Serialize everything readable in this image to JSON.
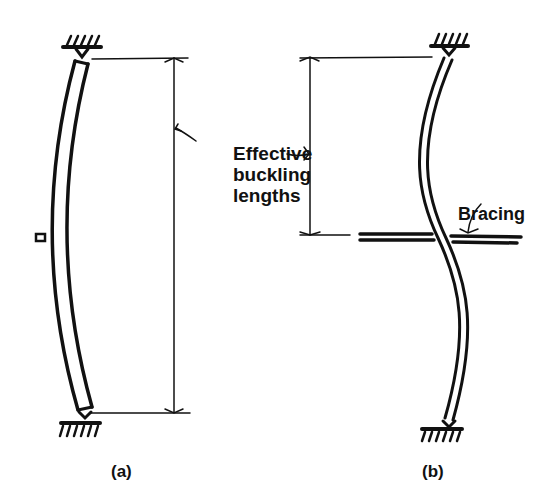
{
  "figure": {
    "annotation": {
      "line1": "Effective",
      "line2": "buckling",
      "line3": "lengths"
    },
    "bracing_label": "Bracing",
    "panels": [
      {
        "caption": "(a)",
        "description": "Pinned column buckling in single curve; effective length equals full height"
      },
      {
        "caption": "(b)",
        "description": "Pinned column braced at mid-height buckling in double curve; effective length equals half height"
      }
    ],
    "colors": {
      "ink": "#111111",
      "background": "#ffffff"
    }
  }
}
